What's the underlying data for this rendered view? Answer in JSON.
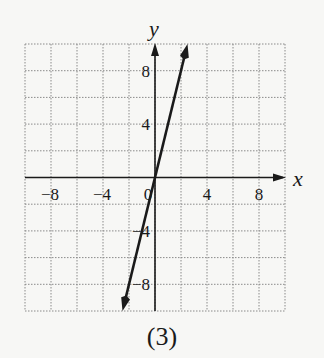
{
  "chart_data": {
    "type": "line",
    "title": "",
    "caption": "(3)",
    "xlabel": "x",
    "ylabel": "y",
    "xlim": [
      -10,
      10
    ],
    "ylim": [
      -10,
      10
    ],
    "grid": true,
    "grid_step": 2,
    "x_ticks": [
      -8,
      -4,
      0,
      4,
      8
    ],
    "x_tick_labels": [
      "−8",
      "−4",
      "0",
      "4",
      "8"
    ],
    "y_ticks": [
      8,
      4,
      -4,
      -8
    ],
    "y_tick_labels": [
      "8",
      "4",
      "−4",
      "−8"
    ],
    "series": [
      {
        "name": "y = 4x",
        "equation": "y = 4x",
        "x": [
          -2.5,
          2.5
        ],
        "y": [
          -10,
          10
        ],
        "arrows": "both"
      }
    ],
    "legend": null
  },
  "figure": {
    "caption": "(3)",
    "x_axis_label": "x",
    "y_axis_label": "y"
  },
  "colors": {
    "ink": "#1a1a1a",
    "grid": "#8a8a8a",
    "background": "#f7f7f5"
  }
}
